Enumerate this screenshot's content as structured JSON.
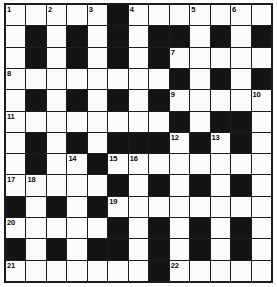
{
  "puzzle": {
    "title": "Crossword Grid",
    "kind": "crossword-grid",
    "columns": 13,
    "rows": 13,
    "colors": {
      "white_cell": "#fbfbfb",
      "black_cell": "#141414",
      "grid_line": "#1c1c1c",
      "number_text": "#0a0a0a",
      "background": "#ffffff"
    },
    "legend": {
      "white": "open letter square",
      "black": "blocked square"
    },
    "clue_number_count": 22,
    "clue_numbers": [
      1,
      2,
      3,
      4,
      5,
      6,
      7,
      8,
      9,
      10,
      11,
      12,
      13,
      14,
      15,
      16,
      17,
      18,
      19,
      20,
      21,
      22
    ],
    "cells": [
      [
        {
          "type": "white",
          "num": "1"
        },
        {
          "type": "white",
          "num": ""
        },
        {
          "type": "white",
          "num": "2"
        },
        {
          "type": "white",
          "num": ""
        },
        {
          "type": "white",
          "num": "3"
        },
        {
          "type": "black",
          "num": ""
        },
        {
          "type": "white",
          "num": "4"
        },
        {
          "type": "white",
          "num": ""
        },
        {
          "type": "white",
          "num": ""
        },
        {
          "type": "white",
          "num": "5"
        },
        {
          "type": "white",
          "num": ""
        },
        {
          "type": "white",
          "num": "6"
        },
        {
          "type": "white",
          "num": ""
        }
      ],
      [
        {
          "type": "white",
          "num": ""
        },
        {
          "type": "black",
          "num": ""
        },
        {
          "type": "white",
          "num": ""
        },
        {
          "type": "black",
          "num": ""
        },
        {
          "type": "white",
          "num": ""
        },
        {
          "type": "black",
          "num": ""
        },
        {
          "type": "white",
          "num": ""
        },
        {
          "type": "black",
          "num": ""
        },
        {
          "type": "black",
          "num": ""
        },
        {
          "type": "white",
          "num": ""
        },
        {
          "type": "black",
          "num": ""
        },
        {
          "type": "white",
          "num": ""
        },
        {
          "type": "black",
          "num": ""
        }
      ],
      [
        {
          "type": "white",
          "num": ""
        },
        {
          "type": "black",
          "num": ""
        },
        {
          "type": "white",
          "num": ""
        },
        {
          "type": "black",
          "num": ""
        },
        {
          "type": "white",
          "num": ""
        },
        {
          "type": "black",
          "num": ""
        },
        {
          "type": "white",
          "num": ""
        },
        {
          "type": "black",
          "num": ""
        },
        {
          "type": "white",
          "num": "7"
        },
        {
          "type": "white",
          "num": ""
        },
        {
          "type": "white",
          "num": ""
        },
        {
          "type": "white",
          "num": ""
        },
        {
          "type": "white",
          "num": ""
        }
      ],
      [
        {
          "type": "white",
          "num": "8"
        },
        {
          "type": "white",
          "num": ""
        },
        {
          "type": "white",
          "num": ""
        },
        {
          "type": "white",
          "num": ""
        },
        {
          "type": "white",
          "num": ""
        },
        {
          "type": "white",
          "num": ""
        },
        {
          "type": "white",
          "num": ""
        },
        {
          "type": "white",
          "num": ""
        },
        {
          "type": "black",
          "num": ""
        },
        {
          "type": "white",
          "num": ""
        },
        {
          "type": "black",
          "num": ""
        },
        {
          "type": "white",
          "num": ""
        },
        {
          "type": "black",
          "num": ""
        }
      ],
      [
        {
          "type": "white",
          "num": ""
        },
        {
          "type": "black",
          "num": ""
        },
        {
          "type": "white",
          "num": ""
        },
        {
          "type": "black",
          "num": ""
        },
        {
          "type": "white",
          "num": ""
        },
        {
          "type": "black",
          "num": ""
        },
        {
          "type": "white",
          "num": ""
        },
        {
          "type": "black",
          "num": ""
        },
        {
          "type": "white",
          "num": "9"
        },
        {
          "type": "white",
          "num": ""
        },
        {
          "type": "white",
          "num": ""
        },
        {
          "type": "white",
          "num": ""
        },
        {
          "type": "white",
          "num": "10"
        }
      ],
      [
        {
          "type": "white",
          "num": "11"
        },
        {
          "type": "white",
          "num": ""
        },
        {
          "type": "white",
          "num": ""
        },
        {
          "type": "white",
          "num": ""
        },
        {
          "type": "white",
          "num": ""
        },
        {
          "type": "white",
          "num": ""
        },
        {
          "type": "white",
          "num": ""
        },
        {
          "type": "white",
          "num": ""
        },
        {
          "type": "black",
          "num": ""
        },
        {
          "type": "white",
          "num": ""
        },
        {
          "type": "black",
          "num": ""
        },
        {
          "type": "black",
          "num": ""
        },
        {
          "type": "white",
          "num": ""
        }
      ],
      [
        {
          "type": "white",
          "num": ""
        },
        {
          "type": "black",
          "num": ""
        },
        {
          "type": "white",
          "num": ""
        },
        {
          "type": "black",
          "num": ""
        },
        {
          "type": "white",
          "num": ""
        },
        {
          "type": "black",
          "num": ""
        },
        {
          "type": "black",
          "num": ""
        },
        {
          "type": "black",
          "num": ""
        },
        {
          "type": "white",
          "num": "12"
        },
        {
          "type": "black",
          "num": ""
        },
        {
          "type": "white",
          "num": "13"
        },
        {
          "type": "black",
          "num": ""
        },
        {
          "type": "white",
          "num": ""
        }
      ],
      [
        {
          "type": "white",
          "num": ""
        },
        {
          "type": "black",
          "num": ""
        },
        {
          "type": "white",
          "num": ""
        },
        {
          "type": "white",
          "num": "14"
        },
        {
          "type": "black",
          "num": ""
        },
        {
          "type": "white",
          "num": "15"
        },
        {
          "type": "white",
          "num": "16"
        },
        {
          "type": "white",
          "num": ""
        },
        {
          "type": "white",
          "num": ""
        },
        {
          "type": "white",
          "num": ""
        },
        {
          "type": "white",
          "num": ""
        },
        {
          "type": "white",
          "num": ""
        },
        {
          "type": "white",
          "num": ""
        }
      ],
      [
        {
          "type": "white",
          "num": "17"
        },
        {
          "type": "white",
          "num": "18"
        },
        {
          "type": "white",
          "num": ""
        },
        {
          "type": "white",
          "num": ""
        },
        {
          "type": "white",
          "num": ""
        },
        {
          "type": "black",
          "num": ""
        },
        {
          "type": "white",
          "num": ""
        },
        {
          "type": "black",
          "num": ""
        },
        {
          "type": "white",
          "num": ""
        },
        {
          "type": "black",
          "num": ""
        },
        {
          "type": "white",
          "num": ""
        },
        {
          "type": "black",
          "num": ""
        },
        {
          "type": "white",
          "num": ""
        }
      ],
      [
        {
          "type": "black",
          "num": ""
        },
        {
          "type": "white",
          "num": ""
        },
        {
          "type": "black",
          "num": ""
        },
        {
          "type": "white",
          "num": ""
        },
        {
          "type": "black",
          "num": ""
        },
        {
          "type": "white",
          "num": "19"
        },
        {
          "type": "white",
          "num": ""
        },
        {
          "type": "white",
          "num": ""
        },
        {
          "type": "white",
          "num": ""
        },
        {
          "type": "white",
          "num": ""
        },
        {
          "type": "white",
          "num": ""
        },
        {
          "type": "white",
          "num": ""
        },
        {
          "type": "white",
          "num": ""
        }
      ],
      [
        {
          "type": "white",
          "num": "20"
        },
        {
          "type": "white",
          "num": ""
        },
        {
          "type": "white",
          "num": ""
        },
        {
          "type": "white",
          "num": ""
        },
        {
          "type": "white",
          "num": ""
        },
        {
          "type": "black",
          "num": ""
        },
        {
          "type": "white",
          "num": ""
        },
        {
          "type": "black",
          "num": ""
        },
        {
          "type": "white",
          "num": ""
        },
        {
          "type": "black",
          "num": ""
        },
        {
          "type": "white",
          "num": ""
        },
        {
          "type": "black",
          "num": ""
        },
        {
          "type": "white",
          "num": ""
        }
      ],
      [
        {
          "type": "black",
          "num": ""
        },
        {
          "type": "white",
          "num": ""
        },
        {
          "type": "black",
          "num": ""
        },
        {
          "type": "white",
          "num": ""
        },
        {
          "type": "black",
          "num": ""
        },
        {
          "type": "black",
          "num": ""
        },
        {
          "type": "white",
          "num": ""
        },
        {
          "type": "black",
          "num": ""
        },
        {
          "type": "white",
          "num": ""
        },
        {
          "type": "black",
          "num": ""
        },
        {
          "type": "white",
          "num": ""
        },
        {
          "type": "black",
          "num": ""
        },
        {
          "type": "white",
          "num": ""
        }
      ],
      [
        {
          "type": "white",
          "num": "21"
        },
        {
          "type": "white",
          "num": ""
        },
        {
          "type": "white",
          "num": ""
        },
        {
          "type": "white",
          "num": ""
        },
        {
          "type": "white",
          "num": ""
        },
        {
          "type": "white",
          "num": ""
        },
        {
          "type": "white",
          "num": ""
        },
        {
          "type": "black",
          "num": ""
        },
        {
          "type": "white",
          "num": "22"
        },
        {
          "type": "white",
          "num": ""
        },
        {
          "type": "white",
          "num": ""
        },
        {
          "type": "white",
          "num": ""
        },
        {
          "type": "white",
          "num": ""
        }
      ]
    ]
  }
}
